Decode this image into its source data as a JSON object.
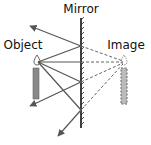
{
  "diagram": {
    "labels": {
      "mirror": "Mirror",
      "object": "Object",
      "image": "Image"
    },
    "colors": {
      "ray": "#555555",
      "virtual_ray": "#666666",
      "mirror": "#111111",
      "candle_body": "#888888",
      "label": "#111111"
    },
    "mirror": {
      "x": 81,
      "y_top": 18,
      "y_bottom": 128
    },
    "object": {
      "flame": [
        37,
        62
      ],
      "body": {
        "x": 33,
        "y": 68,
        "w": 6,
        "h": 31
      }
    },
    "image": {
      "flame": [
        124,
        62
      ],
      "body": {
        "x": 121,
        "y": 68,
        "w": 6,
        "h": 36
      }
    },
    "incident_points": [
      [
        81,
        46
      ],
      [
        81,
        62
      ],
      [
        81,
        82
      ],
      [
        81,
        110
      ]
    ],
    "reflected_ray_ends": [
      [
        30,
        26
      ],
      null,
      [
        30,
        106
      ],
      [
        58,
        136
      ]
    ],
    "caption": ""
  }
}
